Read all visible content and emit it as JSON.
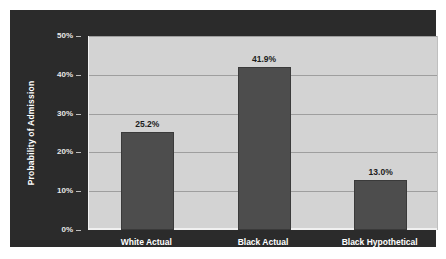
{
  "chart_data": {
    "type": "bar",
    "title": "",
    "xlabel": "",
    "ylabel": "Probability of Admission",
    "categories": [
      "White Actual",
      "Black Actual",
      "Black Hypothetical"
    ],
    "values": [
      25.2,
      41.9,
      13.0
    ],
    "value_labels": [
      "25.2%",
      "41.9%",
      "13.0%"
    ],
    "ylim": [
      0,
      50
    ],
    "yticks": [
      0,
      10,
      20,
      30,
      40,
      50
    ],
    "ytick_labels": [
      "0%",
      "10%",
      "20%",
      "30%",
      "40%",
      "50%"
    ],
    "grid": true,
    "legend": "none",
    "colors": {
      "panel_background": "#2b2b2b",
      "plot_background": "#d3d3d3",
      "bar_fill": "#4d4d4d",
      "bar_border": "#3a3a3a",
      "gridline": "#9e9e9e",
      "axis_text": "#e8e8e8",
      "value_label_text": "#1c1c1c",
      "category_label_text": "#ffffff",
      "page_background": "#ffffff"
    }
  }
}
